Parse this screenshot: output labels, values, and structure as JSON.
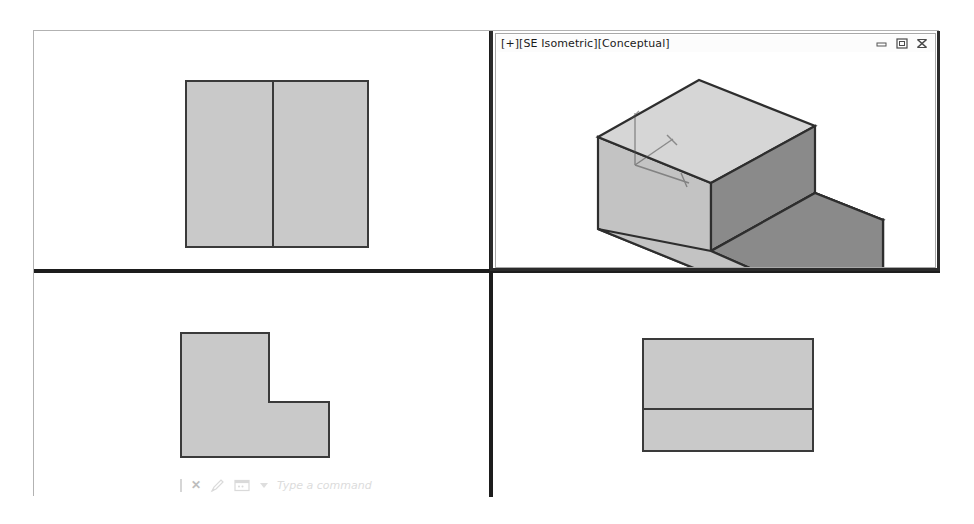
{
  "application": {
    "name": "CAD Multi-Viewport Workspace"
  },
  "active_viewport": {
    "label": "[+][SE Isometric][Conceptual]",
    "projection": "SE Isometric",
    "visual_style": "Conceptual",
    "viewport_controls_marker": "[+]",
    "window_controls": [
      {
        "name": "minimize",
        "glyph": "minimize-icon",
        "tooltip": "Minimize"
      },
      {
        "name": "restore",
        "glyph": "restore-icon",
        "tooltip": "Restore"
      },
      {
        "name": "close",
        "glyph": "close-icon",
        "tooltip": "Close"
      }
    ]
  },
  "viewports": [
    {
      "id": "top-left",
      "name": "top-view",
      "content_description": "Rectangle divided by one vertical line",
      "active": false
    },
    {
      "id": "top-right",
      "name": "isometric-view",
      "content_description": "Shaded 3D isometric step block",
      "active": true
    },
    {
      "id": "bottom-left",
      "name": "front-view",
      "content_description": "L-shaped profile",
      "active": false
    },
    {
      "id": "bottom-right",
      "name": "side-view",
      "content_description": "Rectangle divided by one horizontal line",
      "active": false
    }
  ],
  "command_line": {
    "placeholder": "Type a command",
    "icons": [
      {
        "name": "caret-icon"
      },
      {
        "name": "close-icon",
        "glyph": "✕"
      },
      {
        "name": "pen-icon"
      },
      {
        "name": "command-history-icon"
      },
      {
        "name": "dropdown-arrow-icon",
        "glyph": "▾"
      }
    ]
  },
  "colors": {
    "shape_fill": "#c9c9c9",
    "shape_outline": "#3a3a3a",
    "face_top": "#d6d6d6",
    "face_left": "#c3c3c3",
    "face_right": "#8a8a8a",
    "divider": "#1d1d1d",
    "frame_border": "#b2b2b2",
    "canvas_background": "#ffffff",
    "command_text": "#dcdcdc"
  }
}
